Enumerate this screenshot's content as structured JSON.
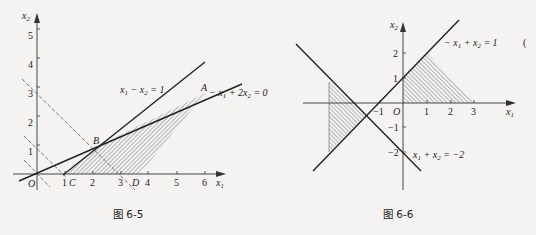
{
  "figures": [
    {
      "caption": "图 6-5",
      "axes": {
        "x_label": "x",
        "x_sub": "1",
        "y_label": "x",
        "y_sub": "2",
        "origin_label": "O",
        "x_ticks": [
          "1",
          "2",
          "3",
          "4",
          "5",
          "6"
        ],
        "y_ticks": [
          "1",
          "2",
          "3",
          "4",
          "5"
        ]
      },
      "lines": [
        {
          "label": "x₁ − x₂ = 1",
          "eq_a": "x",
          "eq_b": "1",
          "eq_c": " − x",
          "eq_d": "2",
          "eq_e": " = 1"
        },
        {
          "label": "−x₁ + 2x₂ = 0",
          "eq_a": "− x",
          "eq_b": "1",
          "eq_c": " + 2x",
          "eq_d": "2",
          "eq_e": " = 0"
        }
      ],
      "points": {
        "A": "A",
        "B": "B",
        "C": "C",
        "D": "D"
      }
    },
    {
      "caption": "图 6-6",
      "axes": {
        "x_label": "x",
        "x_sub": "1",
        "y_label": "x",
        "y_sub": "2",
        "origin_label": "O",
        "x_ticks": [
          "−1",
          "1",
          "2",
          "3"
        ],
        "y_ticks": [
          "2",
          "1",
          "−1",
          "−2"
        ]
      },
      "lines": [
        {
          "label": "−x₁ + x₂ = 1",
          "eq_a": "− x",
          "eq_b": "1",
          "eq_c": " + x",
          "eq_d": "2",
          "eq_e": " = 1"
        },
        {
          "label": "x₁ + x₂ = −2",
          "eq_a": "x",
          "eq_b": "1",
          "eq_c": " + x",
          "eq_d": "2",
          "eq_e": " = −2"
        }
      ]
    }
  ],
  "stray_mark": "("
}
